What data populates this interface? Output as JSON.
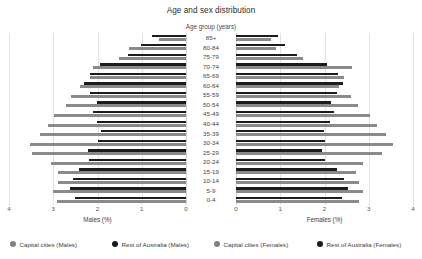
{
  "chart_data": {
    "type": "bar",
    "subtype": "population-pyramid",
    "title": "Age and sex distribution",
    "center_axis_title": "Age group (years)",
    "xlabel_left": "Males (%)",
    "xlabel_right": "Females (%)",
    "ylabel": "Age group (years)",
    "grid": true,
    "legend_position": "bottom",
    "xlim_left": [
      4,
      0
    ],
    "xlim_right": [
      0,
      4
    ],
    "xticks_left": [
      "4",
      "3",
      "2",
      "1",
      "0"
    ],
    "xticks_right": [
      "0",
      "1",
      "2",
      "3",
      "4"
    ],
    "xtick_values_left": [
      4,
      3,
      2,
      1,
      0
    ],
    "xtick_values_right": [
      0,
      1,
      2,
      3,
      4
    ],
    "categories": [
      "85+",
      "80-84",
      "75-79",
      "70-74",
      "65-69",
      "60-64",
      "55-59",
      "50-54",
      "45-49",
      "40-44",
      "35-39",
      "30-34",
      "25-29",
      "20-24",
      "15-19",
      "10-14",
      "5-9",
      "0-4"
    ],
    "series": [
      {
        "name": "Rest of Australia (Males)",
        "side": "left",
        "color": "#1c1c1c",
        "values": [
          0.78,
          1.02,
          1.3,
          1.95,
          2.18,
          2.3,
          2.18,
          2.02,
          2.1,
          2.02,
          1.93,
          1.98,
          2.22,
          2.2,
          2.42,
          2.55,
          2.62,
          2.52
        ]
      },
      {
        "name": "Capital cities (Males)",
        "side": "left",
        "color": "#8a8a8a",
        "values": [
          0.62,
          1.28,
          1.52,
          2.1,
          2.18,
          2.4,
          2.6,
          2.72,
          2.98,
          3.12,
          3.3,
          3.52,
          3.48,
          3.05,
          2.9,
          2.9,
          3.0,
          2.92
        ]
      },
      {
        "name": "Rest of Australia (Females)",
        "side": "right",
        "color": "#1c1c1c",
        "values": [
          0.95,
          1.1,
          1.38,
          2.05,
          2.3,
          2.42,
          2.28,
          2.15,
          2.22,
          2.12,
          1.98,
          2.02,
          1.95,
          2.02,
          2.28,
          2.45,
          2.52,
          2.4
        ]
      },
      {
        "name": "Capital cities (Females)",
        "side": "right",
        "color": "#8a8a8a",
        "values": [
          0.78,
          0.9,
          1.52,
          2.62,
          2.45,
          2.32,
          2.6,
          2.75,
          3.02,
          3.18,
          3.4,
          3.55,
          3.3,
          2.88,
          2.72,
          2.78,
          2.88,
          2.78
        ]
      }
    ],
    "legend": [
      {
        "label": "Capital cities (Males)",
        "color": "#808080",
        "swatch": "gray"
      },
      {
        "label": "Rest of Australia (Males)",
        "color": "#1a1a1a",
        "swatch": "black"
      },
      {
        "label": "Capital cities (Females)",
        "color": "#808080",
        "swatch": "gray"
      },
      {
        "label": "Rest of Australia (Females)",
        "color": "#1a1a1a",
        "swatch": "black"
      }
    ]
  }
}
